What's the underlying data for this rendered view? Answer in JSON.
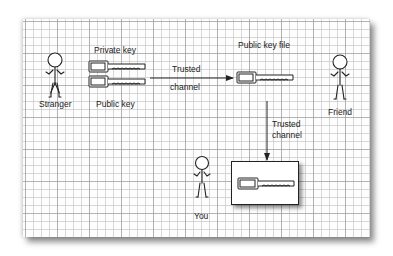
{
  "diagram": {
    "actors": [
      {
        "id": "stranger",
        "label": "Stranger"
      },
      {
        "id": "friend",
        "label": "Friend"
      },
      {
        "id": "you",
        "label": "You"
      }
    ],
    "keys": {
      "private_key_label": "Private key",
      "public_key_label": "Public key",
      "public_key_file_label": "Public key file"
    },
    "channels": {
      "horizontal": {
        "line1": "Trusted",
        "line2": "channel"
      },
      "vertical": {
        "line1": "Trusted",
        "line2": "channel"
      }
    },
    "colors": {
      "ink": "#222222",
      "grid_minor": "#b9b9b9",
      "grid_major": "#969696",
      "paper": "#fdfdfd"
    }
  }
}
